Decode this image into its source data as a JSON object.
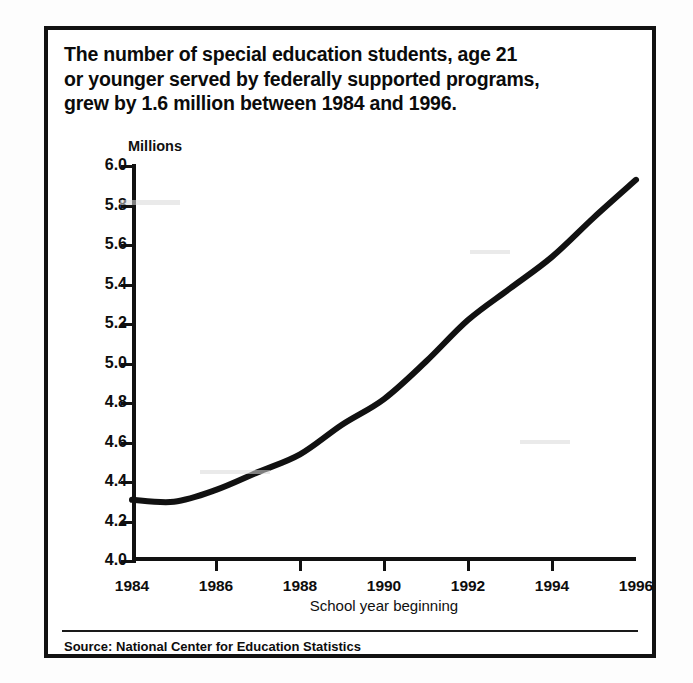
{
  "figure": {
    "title_lines": [
      "The number of special education students, age 21",
      "or younger served by federally supported programs,",
      "grew by 1.6 million between 1984 and 1996."
    ],
    "source_note": "Source: National Center for Education Statistics"
  },
  "chart_data": {
    "type": "line",
    "title": "The number of special education students, age 21 or younger served by federally supported programs, grew by 1.6 million between 1984 and 1996.",
    "xlabel": "School year beginning",
    "ylabel": "Millions",
    "y_unit_label": "Millions",
    "xlim": [
      1984,
      1996
    ],
    "ylim": [
      4.0,
      6.0
    ],
    "ytick_labels": [
      "6.0",
      "5.8",
      "5.6",
      "5.4",
      "5.2",
      "5.0",
      "4.8",
      "4.6",
      "4.4",
      "4.2",
      "4.0"
    ],
    "ytick_values": [
      6.0,
      5.8,
      5.6,
      5.4,
      5.2,
      5.0,
      4.8,
      4.6,
      4.4,
      4.2,
      4.0
    ],
    "xtick_labels": [
      "1984",
      "1986",
      "1988",
      "1990",
      "1992",
      "1994",
      "1996"
    ],
    "xtick_values": [
      1984,
      1986,
      1988,
      1990,
      1992,
      1994,
      1996
    ],
    "grid": false,
    "legend": false,
    "line_color": "#111111",
    "line_width_px": 6,
    "x": [
      1984,
      1985,
      1986,
      1987,
      1988,
      1989,
      1990,
      1991,
      1992,
      1993,
      1994,
      1995,
      1996
    ],
    "values": [
      4.31,
      4.3,
      4.36,
      4.45,
      4.54,
      4.69,
      4.82,
      5.01,
      5.22,
      5.38,
      5.54,
      5.74,
      5.93
    ],
    "series": [
      {
        "name": "Special education students served (millions)",
        "values": [
          4.31,
          4.3,
          4.36,
          4.45,
          4.54,
          4.69,
          4.82,
          5.01,
          5.22,
          5.38,
          5.54,
          5.74,
          5.93
        ]
      }
    ]
  }
}
